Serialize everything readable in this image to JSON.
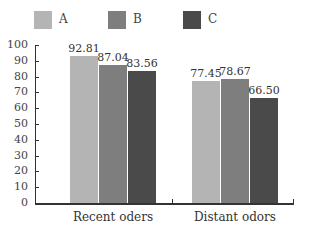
{
  "chart_data": {
    "type": "bar",
    "title": "",
    "xlabel": "",
    "ylabel": "",
    "categories": [
      "Recent oders",
      "Distant odors"
    ],
    "series": [
      {
        "name": "A",
        "color": "#b4b4b4",
        "values": [
          92.81,
          77.45
        ],
        "labels": [
          "92.81",
          "77.45"
        ]
      },
      {
        "name": "B",
        "color": "#7e7e7e",
        "values": [
          87.04,
          78.67
        ],
        "labels": [
          "87.04",
          "78.67"
        ]
      },
      {
        "name": "C",
        "color": "#4a4a4a",
        "values": [
          83.56,
          66.5
        ],
        "labels": [
          "83.56",
          "66.50"
        ]
      }
    ],
    "ylim": [
      0,
      100
    ],
    "yticks": [
      "0",
      "10",
      "20",
      "30",
      "40",
      "50",
      "60",
      "70",
      "80",
      "90",
      "100"
    ],
    "grid": false,
    "legend_position": "top"
  }
}
